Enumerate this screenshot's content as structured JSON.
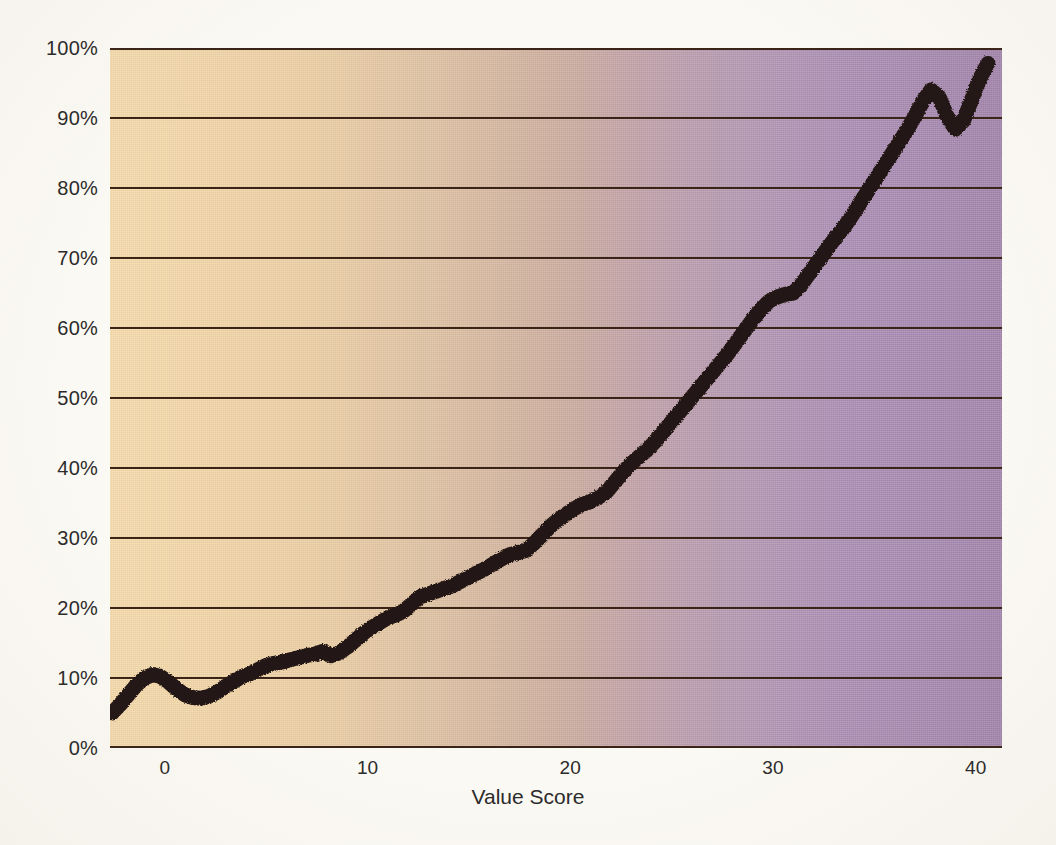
{
  "chart_data": {
    "type": "line",
    "title": "",
    "subtitle": "",
    "xlabel": "Value Score",
    "ylabel": "",
    "xlim": [
      -2.7,
      41.3
    ],
    "ylim": [
      0,
      100
    ],
    "grid": true,
    "legend": false,
    "legend_position": "none",
    "y_tick_labels": [
      "0%",
      "10%",
      "20%",
      "30%",
      "40%",
      "50%",
      "60%",
      "70%",
      "80%",
      "90%",
      "100%"
    ],
    "y_tick_values": [
      0,
      10,
      20,
      30,
      40,
      50,
      60,
      70,
      80,
      90,
      100
    ],
    "x_tick_labels": [
      "0",
      "10",
      "20",
      "30",
      "40"
    ],
    "x_tick_values": [
      0,
      10,
      20,
      30,
      40
    ],
    "series": [
      {
        "name": "Cumulative Percent",
        "color": "#241712",
        "line_width": 15,
        "x": [
          -2.6,
          -2.2,
          -1.8,
          -1.4,
          -1.0,
          -0.6,
          -0.2,
          0.2,
          0.6,
          1.0,
          1.4,
          1.8,
          2.2,
          2.6,
          3.0,
          3.4,
          3.8,
          4.2,
          4.6,
          5.0,
          5.4,
          5.8,
          6.2,
          6.6,
          7.0,
          7.4,
          7.8,
          8.2,
          8.6,
          9.0,
          9.4,
          9.8,
          10.2,
          10.6,
          11.0,
          11.4,
          11.8,
          12.2,
          12.6,
          13.0,
          13.4,
          13.8,
          14.2,
          14.6,
          15.0,
          15.4,
          15.8,
          16.2,
          16.6,
          17.0,
          17.4,
          17.8,
          18.2,
          18.6,
          19.0,
          19.4,
          19.8,
          20.2,
          20.6,
          21.0,
          21.4,
          21.8,
          22.2,
          22.6,
          23.0,
          23.4,
          23.8,
          24.2,
          24.6,
          25.0,
          25.4,
          25.8,
          26.2,
          26.6,
          27.0,
          27.4,
          27.8,
          28.2,
          28.6,
          29.0,
          29.4,
          29.8,
          30.2,
          30.6,
          31.0,
          31.4,
          31.8,
          32.2,
          32.6,
          33.0,
          33.4,
          33.8,
          34.2,
          34.6,
          35.0,
          35.4,
          35.8,
          36.2,
          36.6,
          37.0,
          37.4,
          37.8,
          38.2,
          38.6,
          39.0,
          39.4,
          39.8,
          40.2,
          40.6
        ],
        "y": [
          5.0,
          6.2,
          7.6,
          9.0,
          10.0,
          10.5,
          10.2,
          9.4,
          8.4,
          7.6,
          7.2,
          7.1,
          7.4,
          8.0,
          8.8,
          9.5,
          10.2,
          10.6,
          11.2,
          11.8,
          12.1,
          12.3,
          12.6,
          12.9,
          13.2,
          13.4,
          13.8,
          13.2,
          13.6,
          14.4,
          15.4,
          16.4,
          17.2,
          17.9,
          18.6,
          19.0,
          19.6,
          20.6,
          21.6,
          22.0,
          22.4,
          22.8,
          23.2,
          23.8,
          24.4,
          25.0,
          25.6,
          26.3,
          27.0,
          27.6,
          27.9,
          28.2,
          29.2,
          30.4,
          31.6,
          32.6,
          33.4,
          34.2,
          34.8,
          35.2,
          35.8,
          36.6,
          38.0,
          39.4,
          40.6,
          41.6,
          42.6,
          43.8,
          45.2,
          46.6,
          48.0,
          49.4,
          50.8,
          52.2,
          53.6,
          55.0,
          56.4,
          58.0,
          59.6,
          61.2,
          62.6,
          63.8,
          64.4,
          64.8,
          65.0,
          66.2,
          67.8,
          69.4,
          71.0,
          72.6,
          74.0,
          75.6,
          77.4,
          79.2,
          81.0,
          82.8,
          84.6,
          86.4,
          88.2,
          90.2,
          92.4,
          94.0,
          93.0,
          90.2,
          88.4,
          89.6,
          92.6,
          95.6,
          97.8
        ]
      }
    ],
    "background_gradient": {
      "direction": "horizontal",
      "from": "#f7dcad",
      "mid": "#c9a8a0",
      "to": "#a486ae"
    },
    "gridline_color": "#3a2418",
    "axis_text_color": "#2b2b2b",
    "page_background": "#fbf9f3"
  }
}
